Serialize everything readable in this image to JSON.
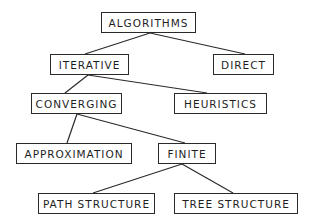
{
  "diagram": {
    "type": "tree",
    "colors": {
      "stroke": "#2a2a2a",
      "text": "#1e1e1e",
      "background": "#ffffff"
    },
    "nodes": [
      {
        "id": "algorithms",
        "label": "ALGORITHMS"
      },
      {
        "id": "iterative",
        "label": "ITERATIVE"
      },
      {
        "id": "direct",
        "label": "DIRECT"
      },
      {
        "id": "converging",
        "label": "CONVERGING"
      },
      {
        "id": "heuristics",
        "label": "HEURISTICS"
      },
      {
        "id": "approximation",
        "label": "APPROXIMATION"
      },
      {
        "id": "finite",
        "label": "FINITE"
      },
      {
        "id": "path_structure",
        "label": "PATH STRUCTURE"
      },
      {
        "id": "tree_structure",
        "label": "TREE STRUCTURE"
      }
    ],
    "edges": [
      {
        "from": "algorithms",
        "to": "iterative"
      },
      {
        "from": "algorithms",
        "to": "direct"
      },
      {
        "from": "iterative",
        "to": "converging"
      },
      {
        "from": "iterative",
        "to": "heuristics"
      },
      {
        "from": "converging",
        "to": "approximation"
      },
      {
        "from": "converging",
        "to": "finite"
      },
      {
        "from": "finite",
        "to": "path_structure"
      },
      {
        "from": "finite",
        "to": "tree_structure"
      }
    ]
  }
}
